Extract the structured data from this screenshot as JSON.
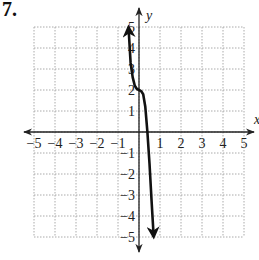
{
  "problem": {
    "number": "7."
  },
  "axes": {
    "x_label": "x",
    "y_label": "y",
    "x_ticks": [
      "−5",
      "−4",
      "−3",
      "−2",
      "−1",
      "1",
      "2",
      "3",
      "4",
      "5"
    ],
    "y_ticks": [
      "5",
      "4",
      "3",
      "2",
      "1",
      "−1",
      "−2",
      "−3",
      "−4",
      "−5"
    ]
  },
  "colors": {
    "grid": "#aaaaaa",
    "axis": "#222222",
    "curve": "#111111"
  },
  "chart_data": {
    "type": "line",
    "title": "",
    "xlabel": "x",
    "ylabel": "y",
    "xlim": [
      -5,
      5
    ],
    "ylim": [
      -5,
      5
    ],
    "grid": true,
    "grid_style": "dotted",
    "series": [
      {
        "name": "f(x)",
        "x": [
          -0.5,
          -0.4,
          -0.3,
          -0.2,
          -0.1,
          0.0,
          0.1,
          0.2,
          0.3,
          0.4,
          0.5,
          0.6,
          0.7
        ],
        "values": [
          5.0,
          3.3,
          2.6,
          2.2,
          2.05,
          2.0,
          1.95,
          1.8,
          1.2,
          0.0,
          -1.5,
          -3.3,
          -5.0
        ]
      }
    ],
    "key_points": [
      {
        "x": 0,
        "y": 2,
        "label": "inflection"
      }
    ]
  }
}
